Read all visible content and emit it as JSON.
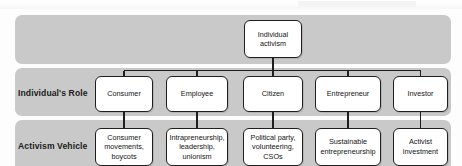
{
  "diagram": {
    "root": {
      "label": "Individual\nactivism"
    },
    "rows": [
      {
        "id": "role",
        "label": "Individual's Role"
      },
      {
        "id": "vehicle",
        "label": "Activism Vehicle"
      }
    ],
    "columns": [
      {
        "role": "Consumer",
        "vehicle": "Consumer movements, boycots"
      },
      {
        "role": "Employee",
        "vehicle": "Intrapreneurship, leadership, unionism"
      },
      {
        "role": "Citizen",
        "vehicle": "Political party, volunteering, CSOs"
      },
      {
        "role": "Entrepreneur",
        "vehicle": "Sustainable entrepreneurship"
      },
      {
        "role": "Investor",
        "vehicle": "Activist investment"
      }
    ],
    "colors": {
      "band": "#c9c9c9",
      "node_fill": "#ffffff",
      "node_border": "#1f1f1f",
      "text": "#141414",
      "background": "#fdfdfd"
    }
  }
}
